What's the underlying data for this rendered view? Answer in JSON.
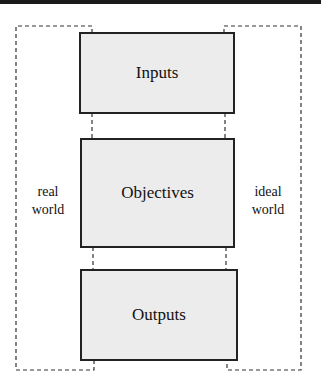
{
  "diagram": {
    "boxes": [
      {
        "id": "inputs",
        "label": "Inputs"
      },
      {
        "id": "objectives",
        "label": "Objectives"
      },
      {
        "id": "outputs",
        "label": "Outputs"
      }
    ],
    "left_region": {
      "line1": "real",
      "line2": "world"
    },
    "right_region": {
      "line1": "ideal",
      "line2": "world"
    },
    "colors": {
      "box_fill": "#ececec",
      "box_border": "#222222",
      "dashed": "#333333",
      "top_bar": "#1a1a1a"
    }
  }
}
